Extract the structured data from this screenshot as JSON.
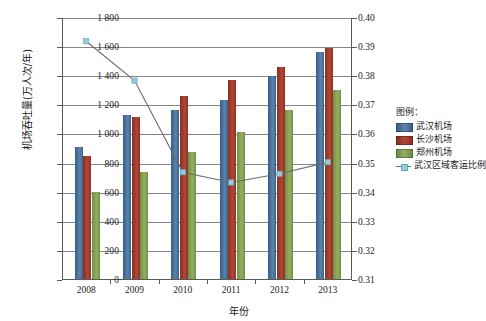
{
  "chart_data": {
    "type": "bar",
    "title": "",
    "xlabel": "年份",
    "ylabel": "机场吞吐量(万人次/年)",
    "y2label": "",
    "categories": [
      "2008",
      "2009",
      "2010",
      "2011",
      "2012",
      "2013"
    ],
    "ylim": [
      0,
      1800
    ],
    "ytick_step": 200,
    "yticks": [
      "0",
      "200",
      "400",
      "600",
      "800",
      "1 000",
      "1 200",
      "1 400",
      "1 600",
      "1 800"
    ],
    "y2lim": [
      0.31,
      0.4
    ],
    "y2tick_step": 0.01,
    "y2ticks": [
      "0.31",
      "0.32",
      "0.33",
      "0.34",
      "0.35",
      "0.36",
      "0.37",
      "0.38",
      "0.39",
      "0.40"
    ],
    "grid": true,
    "legend_position": "right",
    "series": [
      {
        "name": "武汉机场",
        "type": "bar",
        "axis": "left",
        "color": "#4a739f",
        "values": [
          910,
          1130,
          1160,
          1232,
          1395,
          1560
        ]
      },
      {
        "name": "长沙机场",
        "type": "bar",
        "axis": "left",
        "color": "#a33c2b",
        "values": [
          845,
          1115,
          1255,
          1365,
          1460,
          1590
        ]
      },
      {
        "name": "郑州机场",
        "type": "bar",
        "axis": "left",
        "color": "#86a356",
        "values": [
          595,
          735,
          875,
          1010,
          1160,
          1300
        ]
      },
      {
        "name": "武汉区域客运比例",
        "type": "line",
        "axis": "right",
        "color": "#6b6b6b",
        "marker_color": "#92cddc",
        "values": [
          0.392,
          0.3785,
          0.347,
          0.3435,
          0.3465,
          0.3505
        ]
      }
    ]
  },
  "legend": {
    "title": "图例：",
    "items": [
      {
        "label": "武汉机场"
      },
      {
        "label": "长沙机场"
      },
      {
        "label": "郑州机场"
      },
      {
        "label": "武汉区域客运比例"
      }
    ]
  },
  "colors": {
    "series_wuhan": "#4a739f",
    "series_changsha": "#a33c2b",
    "series_zhengzhou": "#86a356",
    "series_ratio_line": "#6b6b6b",
    "series_ratio_marker": "#92cddc",
    "grid": "#868686",
    "axis": "#5a5a5a"
  }
}
